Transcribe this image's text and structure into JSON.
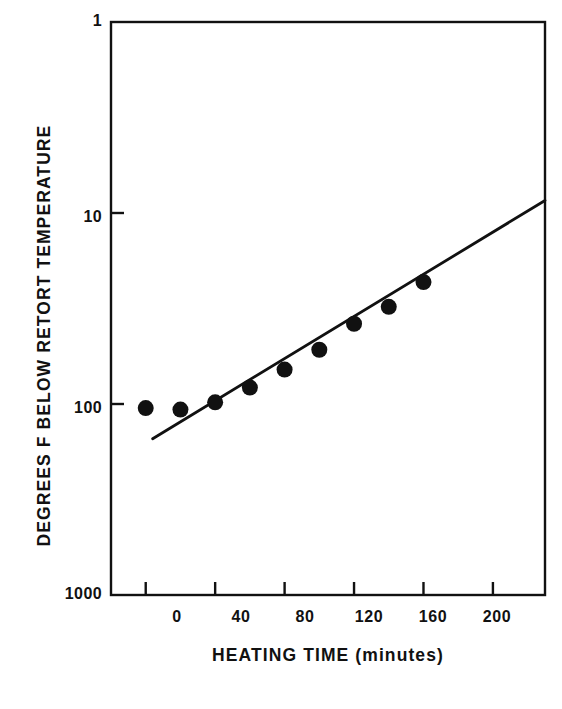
{
  "chart_data": {
    "type": "scatter",
    "title": "",
    "subtitle": "",
    "xlabel": "HEATING TIME  (minutes)",
    "ylabel": "DEGREES F BELOW RETORT TEMPERATURE",
    "x_unit": "minutes",
    "y_unit": "degrees F below retort temperature",
    "y_scale": "log",
    "y_inverted": true,
    "grid": false,
    "legend": null,
    "xlim": [
      -20,
      230
    ],
    "ylim": [
      1,
      1000
    ],
    "xticks": [
      0,
      40,
      80,
      120,
      160,
      200
    ],
    "xtick_labels": [
      "0",
      "40",
      "80",
      "120",
      "160",
      "200"
    ],
    "yticks": [
      1,
      10,
      100,
      1000
    ],
    "ytick_labels": [
      "1",
      "10",
      "100",
      "1000"
    ],
    "series": [
      {
        "name": "Measured heat penetration",
        "marker": "filled-circle",
        "color": "#111111",
        "points": [
          {
            "x": 0,
            "y": 105
          },
          {
            "x": 20,
            "y": 107
          },
          {
            "x": 40,
            "y": 98
          },
          {
            "x": 60,
            "y": 82
          },
          {
            "x": 80,
            "y": 66
          },
          {
            "x": 100,
            "y": 52
          },
          {
            "x": 120,
            "y": 38
          },
          {
            "x": 140,
            "y": 31
          },
          {
            "x": 160,
            "y": 23
          }
        ]
      },
      {
        "name": "Fitted straight line",
        "marker": "none",
        "color": "#111111",
        "line_endpoints": [
          {
            "x": 4,
            "y": 152
          },
          {
            "x": 230,
            "y": 8.6
          }
        ]
      }
    ]
  },
  "axes": {
    "x_tick_labels": [
      "0",
      "40",
      "80",
      "120",
      "160",
      "200"
    ],
    "y_tick_labels": [
      "1",
      "10",
      "100",
      "1000"
    ],
    "x_axis_title": "HEATING TIME  (minutes)",
    "y_axis_title": "DEGREES F BELOW RETORT TEMPERATURE"
  },
  "style": {
    "ink_color": "#111111",
    "background_color": "#ffffff",
    "marker_radius_px": 8,
    "axis_line_width_px": 2.4,
    "data_line_width_px": 2.8
  }
}
